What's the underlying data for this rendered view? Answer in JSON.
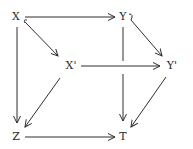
{
  "diagram": {
    "type": "commutative-diagram",
    "nodes": {
      "X": {
        "label": "X",
        "x": 16,
        "y": 17
      },
      "Y": {
        "label": "Y",
        "x": 123,
        "y": 17
      },
      "Xp": {
        "label": "X'",
        "x": 70,
        "y": 66
      },
      "Yp": {
        "label": "Y'",
        "x": 171,
        "y": 66
      },
      "Z": {
        "label": "Z",
        "x": 16,
        "y": 137
      },
      "T": {
        "label": "T",
        "x": 123,
        "y": 137
      }
    },
    "edges": [
      {
        "from": "X",
        "to": "Y",
        "style": "arrow"
      },
      {
        "from": "X",
        "to": "Xp",
        "style": "hook-arrow"
      },
      {
        "from": "X",
        "to": "Z",
        "style": "arrow"
      },
      {
        "from": "Y",
        "to": "Yp",
        "style": "hook-arrow"
      },
      {
        "from": "Y",
        "to": "T",
        "style": "arrow",
        "note": "broken where X'→Y' crosses"
      },
      {
        "from": "Xp",
        "to": "Yp",
        "style": "arrow"
      },
      {
        "from": "Xp",
        "to": "Z",
        "style": "arrow"
      },
      {
        "from": "Yp",
        "to": "T",
        "style": "arrow"
      },
      {
        "from": "Z",
        "to": "T",
        "style": "arrow"
      }
    ],
    "colors": {
      "line": "#2f2f2f",
      "text": "#2a2a2a",
      "background": "#ffffff"
    }
  }
}
